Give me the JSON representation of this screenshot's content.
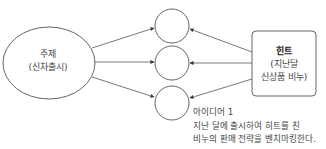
{
  "topic": {
    "title": "주제",
    "subtitle": "(신차출시)"
  },
  "hint": {
    "title": "힌트",
    "line1": "(지난달",
    "line2": "신상품 비누)"
  },
  "idea_nodes": [
    {
      "label": ""
    },
    {
      "label": ""
    },
    {
      "label": ""
    }
  ],
  "idea_note": {
    "title": "아이디어 1",
    "line1": "지난 달에 출시하여 히트를 친",
    "line2": "비누의 판매 전략을 벤치마킹한다."
  },
  "colors": {
    "stroke": "#555555",
    "text": "#444444",
    "background": "#ffffff"
  }
}
